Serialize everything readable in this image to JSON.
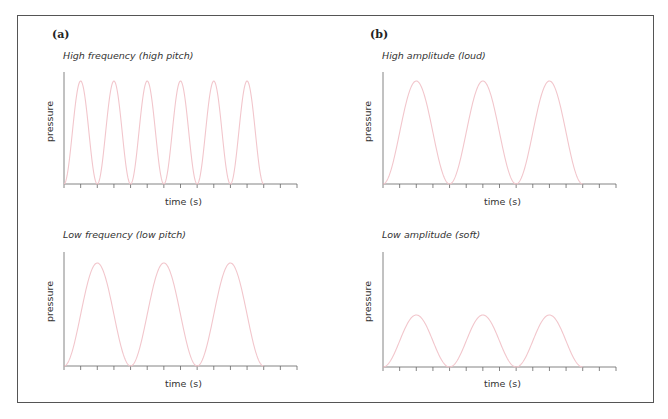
{
  "figure": {
    "panels": [
      {
        "id": "a-top",
        "panel_label": "(a)",
        "title": "High frequency (high pitch)",
        "ylabel": "pressure",
        "xlabel": "time (s)"
      },
      {
        "id": "b-top",
        "panel_label": "(b)",
        "title": "High amplitude (loud)",
        "ylabel": "pressure",
        "xlabel": "time (s)"
      },
      {
        "id": "a-bottom",
        "panel_label": "",
        "title": "Low frequency (low pitch)",
        "ylabel": "pressure",
        "xlabel": "time (s)"
      },
      {
        "id": "b-bottom",
        "panel_label": "",
        "title": "Low amplitude (soft)",
        "ylabel": "pressure",
        "xlabel": "time (s)"
      }
    ],
    "colors": {
      "curve": "#f2c6cc",
      "axis": "#666666",
      "border": "#555555"
    }
  },
  "chart_data": [
    {
      "type": "line",
      "title": "High frequency (high pitch)",
      "xlabel": "time (s)",
      "ylabel": "pressure",
      "cycles": 6,
      "amplitude": 1.0,
      "ticks": 14
    },
    {
      "type": "line",
      "title": "High amplitude (loud)",
      "xlabel": "time (s)",
      "ylabel": "pressure",
      "cycles": 3,
      "amplitude": 1.0,
      "ticks": 14
    },
    {
      "type": "line",
      "title": "Low frequency (low pitch)",
      "xlabel": "time (s)",
      "ylabel": "pressure",
      "cycles": 3,
      "amplitude": 1.0,
      "ticks": 14
    },
    {
      "type": "line",
      "title": "Low amplitude (soft)",
      "xlabel": "time (s)",
      "ylabel": "pressure",
      "cycles": 3,
      "amplitude": 0.5,
      "ticks": 14
    }
  ]
}
